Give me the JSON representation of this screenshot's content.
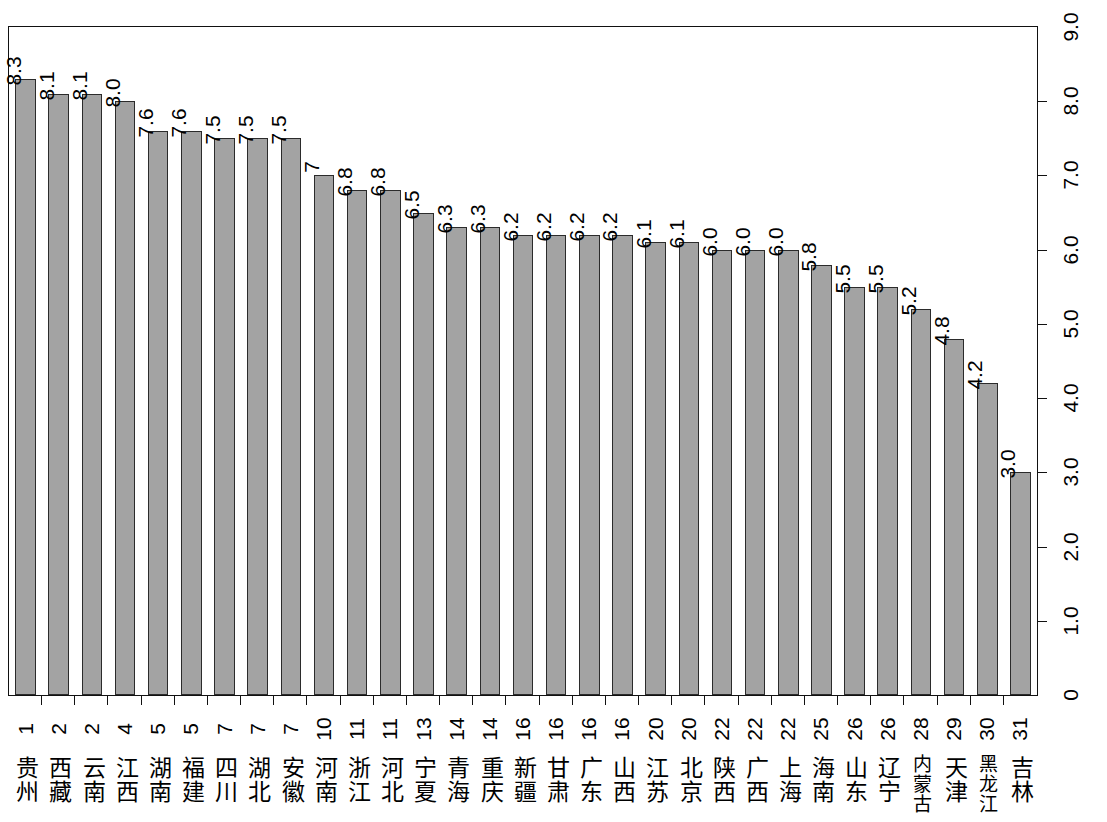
{
  "chart_data": {
    "type": "bar",
    "title": "",
    "subtitle": "",
    "xlabel": "",
    "ylabel": "",
    "ylim": [
      0,
      9.0
    ],
    "grid": false,
    "legend": null,
    "orientation": "vertical",
    "bar_color": "#a3a3a3",
    "bar_border_color": "#2b2b2b",
    "y_ticks": [
      "0",
      "1.0",
      "2.0",
      "3.0",
      "4.0",
      "5.0",
      "6.0",
      "7.0",
      "8.0",
      "9.0"
    ],
    "y_tick_values": [
      0,
      1,
      2,
      3,
      4,
      5,
      6,
      7,
      8,
      9
    ],
    "y_axis_position": "right",
    "categories": [
      "贵州",
      "西藏",
      "云南",
      "江西",
      "湖南",
      "福建",
      "四川",
      "湖北",
      "安徽",
      "河南",
      "浙江",
      "河北",
      "宁夏",
      "青海",
      "重庆",
      "新疆",
      "甘肃",
      "广东",
      "山西",
      "江苏",
      "北京",
      "陕西",
      "广西",
      "上海",
      "海南",
      "山东",
      "辽宁",
      "内蒙古",
      "天津",
      "黑龙江",
      "吉林"
    ],
    "ranks": [
      "1",
      "2",
      "2",
      "4",
      "5",
      "5",
      "7",
      "7",
      "7",
      "10",
      "11",
      "11",
      "13",
      "14",
      "14",
      "16",
      "16",
      "16",
      "16",
      "20",
      "20",
      "22",
      "22",
      "22",
      "25",
      "26",
      "26",
      "28",
      "29",
      "30",
      "31"
    ],
    "values": [
      8.3,
      8.1,
      8.1,
      8.0,
      7.6,
      7.6,
      7.5,
      7.5,
      7.5,
      7.0,
      6.8,
      6.8,
      6.5,
      6.3,
      6.3,
      6.2,
      6.2,
      6.2,
      6.2,
      6.1,
      6.1,
      6.0,
      6.0,
      6.0,
      5.8,
      5.5,
      5.5,
      5.2,
      4.8,
      4.2,
      3.0
    ],
    "value_labels": [
      "8.3",
      "8.1",
      "8.1",
      "8.0",
      "7.6",
      "7.6",
      "7.5",
      "7.5",
      "7.5",
      "7",
      "6.8",
      "6.8",
      "6.5",
      "6.3",
      "6.3",
      "6.2",
      "6.2",
      "6.2",
      "6.2",
      "6.1",
      "6.1",
      "6.0",
      "6.0",
      "6.0",
      "5.8",
      "5.5",
      "5.5",
      "5.2",
      "4.8",
      "4.2",
      "3.0"
    ]
  }
}
